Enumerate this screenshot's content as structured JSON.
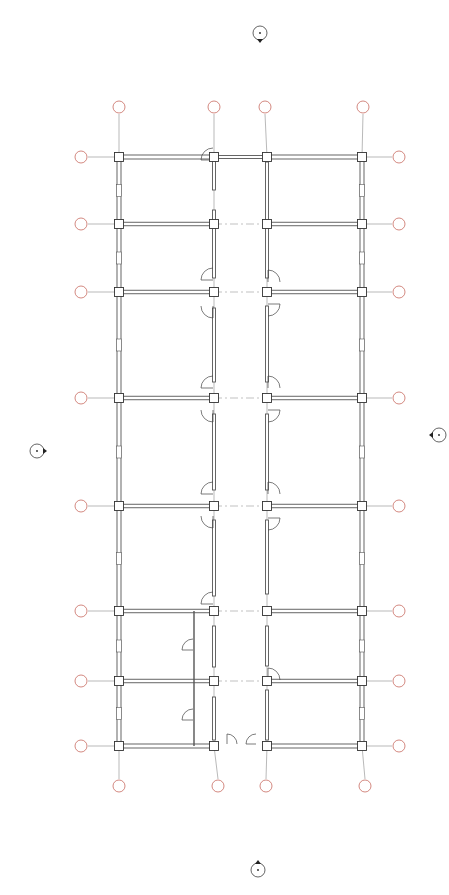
{
  "drawing": {
    "type": "floor-plan",
    "colors": {
      "wall": "#555555",
      "grid_line": "#888888",
      "grid_bubble_stroke": "#c0564a",
      "grid_label": "#c0564a",
      "column": "#ffffff",
      "column_stroke": "#333333",
      "door": "#444444",
      "marker": "#222222"
    },
    "columns_x": [
      119,
      214,
      267,
      362
    ],
    "rows_y": [
      157,
      224,
      292,
      398,
      506,
      611,
      681,
      746
    ],
    "grid_top_bubbles": [
      {
        "x": 119,
        "label": ""
      },
      {
        "x": 214,
        "label": ""
      },
      {
        "x": 265,
        "label": ""
      },
      {
        "x": 363,
        "label": ""
      }
    ],
    "grid_bottom_bubbles": [
      {
        "x": 119,
        "label": ""
      },
      {
        "x": 218,
        "label": ""
      },
      {
        "x": 266,
        "label": ""
      },
      {
        "x": 365,
        "label": ""
      }
    ],
    "grid_left_bubbles_y": [
      157,
      224,
      292,
      398,
      506,
      611,
      681,
      746
    ],
    "grid_right_bubbles_y": [
      157,
      224,
      292,
      398,
      506,
      611,
      681,
      746
    ],
    "section_markers": [
      {
        "name": "top",
        "x": 260,
        "y": 33
      },
      {
        "name": "bottom",
        "x": 258,
        "y": 870
      },
      {
        "name": "left",
        "x": 37,
        "y": 451
      },
      {
        "name": "right",
        "x": 439,
        "y": 435
      }
    ]
  }
}
